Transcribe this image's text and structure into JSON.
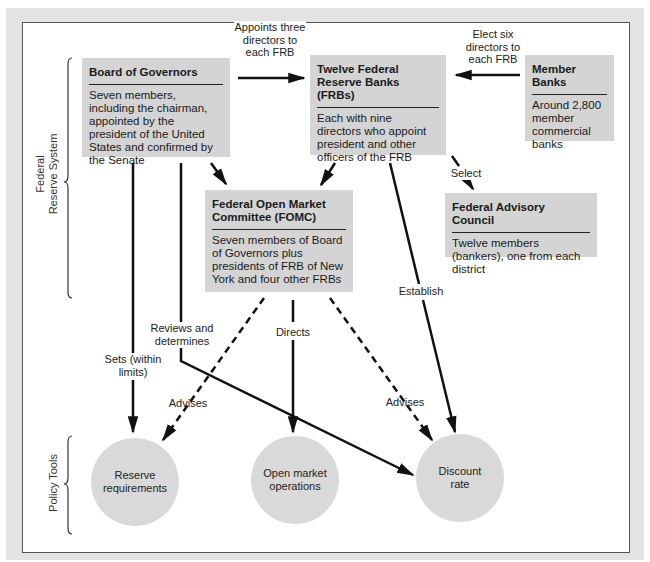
{
  "diagram": {
    "side_labels": {
      "federal_reserve_system": "Federal\nReserve System",
      "federal_reserve_system_line1": "Federal",
      "federal_reserve_system_line2": "Reserve System",
      "policy_tools": "Policy Tools"
    },
    "boxes": {
      "board": {
        "title": "Board of Governors",
        "body": "Seven members, including the chairman, appointed by the president of the United States and confirmed by the Senate"
      },
      "frb": {
        "title": "Twelve Federal Reserve Banks (FRBs)",
        "body": "Each with nine directors who appoint president and other officers of the FRB"
      },
      "member_banks": {
        "title": "Member Banks",
        "body": "Around 2,800 member commercial banks"
      },
      "fomc": {
        "title": "Federal Open Market Committee (FOMC)",
        "body": "Seven members of Board of Governors plus presidents of FRB of New York and four other FRBs"
      },
      "advisory": {
        "title": "Federal Advisory Council",
        "body": "Twelve members (bankers), one from each district"
      }
    },
    "policy_tools": [
      {
        "label": "Reserve requirements"
      },
      {
        "label": "Open market operations"
      },
      {
        "label": "Discount rate"
      }
    ],
    "edge_labels": {
      "appoints": "Appoints three directors to each FRB",
      "elect": "Elect six directors to each FRB",
      "select": "Select",
      "establish": "Establish",
      "reviews": "Reviews and determines",
      "sets": "Sets (within limits)",
      "directs": "Directs",
      "advises_left": "Advises",
      "advises_right": "Advises"
    },
    "colors": {
      "box_fill": "#d4d4d4",
      "circle_fill": "#d9d9d9",
      "background": "#e3e3e3",
      "line": "#111111"
    }
  }
}
